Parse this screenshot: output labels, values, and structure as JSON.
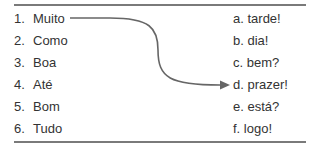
{
  "left_column": [
    {
      "num": "1.",
      "word": "Muito"
    },
    {
      "num": "2.",
      "word": "Como"
    },
    {
      "num": "3.",
      "word": "Boa"
    },
    {
      "num": "4.",
      "word": "Até"
    },
    {
      "num": "5.",
      "word": "Bom"
    },
    {
      "num": "6.",
      "word": "Tudo"
    }
  ],
  "right_column": [
    {
      "letter": "a.",
      "word": "tarde!"
    },
    {
      "letter": "b.",
      "word": "dia!"
    },
    {
      "letter": "c.",
      "word": "bem?"
    },
    {
      "letter": "d.",
      "word": "prazer!"
    },
    {
      "letter": "e.",
      "word": "está?"
    },
    {
      "letter": "f.",
      "word": "logo!"
    }
  ],
  "example_match": {
    "from": "1",
    "to": "d"
  },
  "colors": {
    "rule": "#7a7a7a",
    "arrow": "#666666",
    "text": "#333333"
  }
}
